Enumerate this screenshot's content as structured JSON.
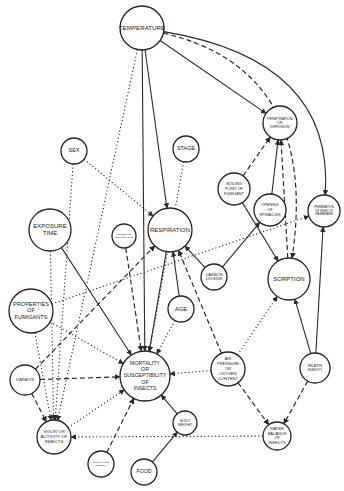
{
  "figure": {
    "legend_line_styles": {
      "solid": "direct influence",
      "dashed": "influence",
      "dotted": "influence"
    },
    "nodes": [
      {
        "id": "temperature",
        "lines": [
          "TEMPERATURE"
        ]
      },
      {
        "id": "sex",
        "lines": [
          "SEX"
        ]
      },
      {
        "id": "stage",
        "lines": [
          "STAGE"
        ]
      },
      {
        "id": "penetration",
        "lines": [
          "PENETRATION",
          "OR",
          "DIFFUSION"
        ]
      },
      {
        "id": "boiling",
        "lines": [
          "BOILING",
          "POINT OF",
          "FUMIGANT"
        ]
      },
      {
        "id": "spiracles",
        "lines": [
          "OPENING",
          "OF",
          "SPIRACLES"
        ]
      },
      {
        "id": "permeation",
        "lines": [
          "PERMEATION",
          "OF INSECTS",
          "MEMBRANE"
        ]
      },
      {
        "id": "exposure",
        "lines": [
          "EXPOSURE",
          "TIME"
        ]
      },
      {
        "id": "regurgitation",
        "lines": [
          "PROTECTIVE",
          "REGURGITATION"
        ]
      },
      {
        "id": "respiration",
        "lines": [
          "RESPIRATION"
        ]
      },
      {
        "id": "co2",
        "lines": [
          "CARBON",
          "DIOXIDE"
        ]
      },
      {
        "id": "sorption",
        "lines": [
          "SORPTION"
        ]
      },
      {
        "id": "properties",
        "lines": [
          "PROPERTIES",
          "OF",
          "FUMIGANTS"
        ]
      },
      {
        "id": "age",
        "lines": [
          "AGE"
        ]
      },
      {
        "id": "starvation",
        "lines": [
          "STARVATION"
        ]
      },
      {
        "id": "mortality",
        "lines": [
          "MORTALITY",
          "OR",
          "SUSCEPTIBILITY",
          "OF",
          "INSECTS"
        ]
      },
      {
        "id": "air",
        "lines": [
          "AIR",
          "PRESSURE",
          "OR",
          "OXYGEN",
          "CONTENT"
        ]
      },
      {
        "id": "humidity",
        "lines": [
          "RELATIVE",
          "HUMIDITY"
        ]
      },
      {
        "id": "vigor",
        "lines": [
          "VIGOR OR",
          "ACTIVITY OF",
          "INSECTS"
        ]
      },
      {
        "id": "bodyweight",
        "lines": [
          "BODY",
          "WEIGHT"
        ]
      },
      {
        "id": "water",
        "lines": [
          "WATER",
          "BALANCE",
          "OF",
          "INSECTS"
        ]
      },
      {
        "id": "population",
        "lines": [
          "POPULATION",
          "DENSITY"
        ]
      },
      {
        "id": "food",
        "lines": [
          "FOOD"
        ]
      }
    ],
    "edges": [
      {
        "from": "temperature",
        "to": "mortality",
        "style": "solid"
      },
      {
        "from": "temperature",
        "to": "respiration",
        "style": "solid"
      },
      {
        "from": "temperature",
        "to": "penetration",
        "style": "solid"
      },
      {
        "from": "temperature",
        "to": "sorption",
        "style": "dashed"
      },
      {
        "from": "temperature",
        "to": "permeation",
        "style": "solid"
      },
      {
        "from": "temperature",
        "to": "vigor",
        "style": "dotted"
      },
      {
        "from": "sex",
        "to": "respiration",
        "style": "dotted"
      },
      {
        "from": "sex",
        "to": "vigor",
        "style": "dotted"
      },
      {
        "from": "stage",
        "to": "mortality",
        "style": "dotted"
      },
      {
        "from": "boiling",
        "to": "penetration",
        "style": "dashed"
      },
      {
        "from": "boiling",
        "to": "sorption",
        "style": "solid"
      },
      {
        "from": "spiracles",
        "to": "penetration",
        "style": "solid"
      },
      {
        "from": "sorption",
        "to": "penetration",
        "style": "dashed"
      },
      {
        "from": "exposure",
        "to": "mortality",
        "style": "solid"
      },
      {
        "from": "regurgitation",
        "to": "mortality",
        "style": "dashed"
      },
      {
        "from": "co2",
        "to": "respiration",
        "style": "solid"
      },
      {
        "from": "co2",
        "to": "spiracles",
        "style": "solid"
      },
      {
        "from": "age",
        "to": "respiration",
        "style": "solid"
      },
      {
        "from": "age",
        "to": "mortality",
        "style": "dotted"
      },
      {
        "from": "respiration",
        "to": "mortality",
        "style": "solid"
      },
      {
        "from": "air",
        "to": "respiration",
        "style": "dashed"
      },
      {
        "from": "properties",
        "to": "permeation",
        "style": "dotted"
      },
      {
        "from": "properties",
        "to": "mortality",
        "style": "dotted"
      },
      {
        "from": "properties",
        "to": "vigor",
        "style": "dotted"
      },
      {
        "from": "starvation",
        "to": "respiration",
        "style": "dashed"
      },
      {
        "from": "starvation",
        "to": "mortality",
        "style": "dashed"
      },
      {
        "from": "starvation",
        "to": "vigor",
        "style": "dashed"
      },
      {
        "from": "vigor",
        "to": "mortality",
        "style": "dotted"
      },
      {
        "from": "air",
        "to": "sorption",
        "style": "dotted"
      },
      {
        "from": "air",
        "to": "mortality",
        "style": "dotted"
      },
      {
        "from": "air",
        "to": "water",
        "style": "dashed"
      },
      {
        "from": "humidity",
        "to": "sorption",
        "style": "solid"
      },
      {
        "from": "humidity",
        "to": "permeation",
        "style": "solid"
      },
      {
        "from": "humidity",
        "to": "water",
        "style": "dashed"
      },
      {
        "from": "bodyweight",
        "to": "mortality",
        "style": "solid"
      },
      {
        "from": "water",
        "to": "vigor",
        "style": "dotted"
      },
      {
        "from": "population",
        "to": "mortality",
        "style": "dashed"
      },
      {
        "from": "food",
        "to": "bodyweight",
        "style": "solid"
      },
      {
        "from": "exposure",
        "to": "vigor",
        "style": "dotted"
      }
    ]
  }
}
